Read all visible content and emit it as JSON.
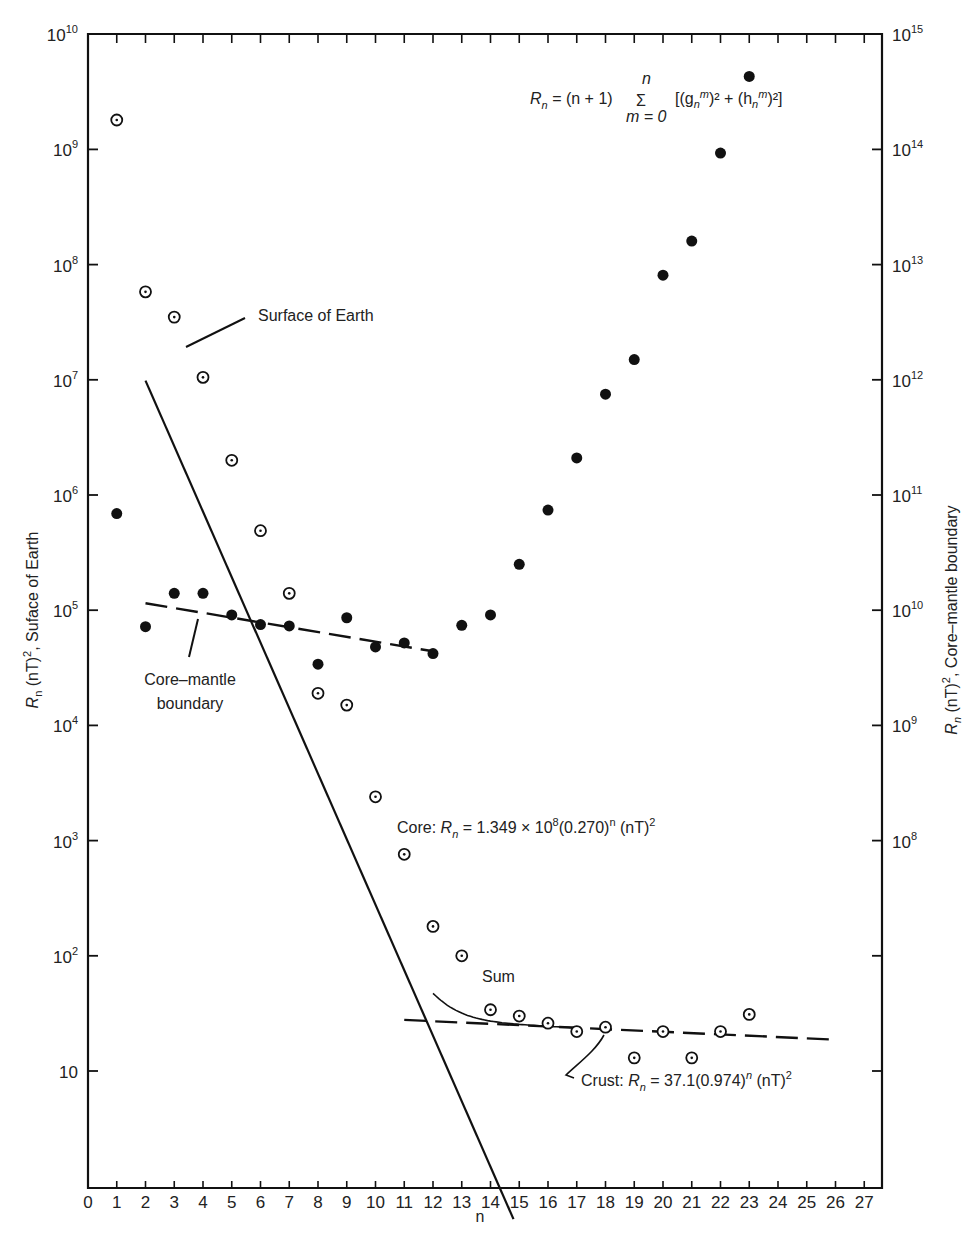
{
  "chart_data": {
    "type": "scatter",
    "title": "",
    "xlabel": "n",
    "ylabel_left": "Rn (nT)², Suface of Earth",
    "ylabel_right": "Rn (nT)², Core–mantle boundary",
    "x_ticks": [
      0,
      1,
      2,
      3,
      4,
      5,
      6,
      7,
      8,
      9,
      10,
      11,
      12,
      13,
      14,
      15,
      16,
      17,
      18,
      19,
      20,
      21,
      22,
      23,
      24,
      25,
      26,
      27
    ],
    "xlim": [
      0,
      27.8
    ],
    "yscale": "log",
    "ylim_left": [
      1,
      10000000000
    ],
    "ylim_right": [
      100000,
      1000000000000000
    ],
    "left_tick_labels": [
      {
        "base": "10",
        "exp": "10",
        "value": 10000000000.0
      },
      {
        "base": "10",
        "exp": "9",
        "value": 1000000000.0
      },
      {
        "base": "10",
        "exp": "8",
        "value": 100000000.0
      },
      {
        "base": "10",
        "exp": "7",
        "value": 10000000.0
      },
      {
        "base": "10",
        "exp": "6",
        "value": 1000000.0
      },
      {
        "base": "10",
        "exp": "5",
        "value": 100000.0
      },
      {
        "base": "10",
        "exp": "4",
        "value": 10000.0
      },
      {
        "base": "10",
        "exp": "3",
        "value": 1000.0
      },
      {
        "base": "10",
        "exp": "2",
        "value": 100.0
      },
      {
        "base": "10",
        "exp": "",
        "value": 10
      }
    ],
    "right_tick_labels": [
      {
        "base": "10",
        "exp": "15",
        "value": 1000000000000000.0
      },
      {
        "base": "10",
        "exp": "14",
        "value": 100000000000000.0
      },
      {
        "base": "10",
        "exp": "13",
        "value": 10000000000000.0
      },
      {
        "base": "10",
        "exp": "12",
        "value": 1000000000000.0
      },
      {
        "base": "10",
        "exp": "11",
        "value": 100000000000.0
      },
      {
        "base": "10",
        "exp": "10",
        "value": 10000000000.0
      },
      {
        "base": "10",
        "exp": "9",
        "value": 1000000000.0
      },
      {
        "base": "10",
        "exp": "8",
        "value": 100000000.0
      },
      {
        "base": "",
        "exp": "",
        "value": 10000000.0
      },
      {
        "base": "",
        "exp": "",
        "value": 1000000.0
      }
    ],
    "grid": false,
    "series": [
      {
        "name": "Surface of Earth",
        "marker": "open-circle-dot",
        "axis": "left",
        "x": [
          1,
          2,
          3,
          4,
          5,
          6,
          7,
          8,
          9,
          10,
          11,
          12,
          13,
          14,
          15,
          16,
          17,
          18,
          19,
          20,
          21,
          22,
          23
        ],
        "values": [
          1800000000,
          58000000,
          35000000,
          10500000,
          2000000,
          490000,
          140000,
          19000,
          15000,
          2400,
          760,
          180,
          100,
          34,
          30,
          26,
          22,
          24,
          13,
          22,
          13,
          22,
          31
        ]
      },
      {
        "name": "Core–mantle boundary",
        "marker": "filled-circle",
        "axis": "right",
        "x": [
          1,
          2,
          3,
          4,
          5,
          6,
          7,
          8,
          9,
          10,
          11,
          12,
          13,
          14,
          15,
          16,
          17,
          18,
          19,
          20,
          21,
          22,
          23
        ],
        "values": [
          69000000000,
          7200000000,
          14000000000,
          14000000000,
          9100000000,
          7500000000,
          7300000000,
          3400000000,
          8600000000,
          4800000000,
          5200000000,
          4200000000,
          7400000000,
          9100000000,
          25000000000,
          74000000000,
          210000000000,
          750000000000,
          1500000000000,
          8100000000000,
          16000000000000,
          93000000000000,
          430000000000000
        ]
      }
    ],
    "fit_lines": [
      {
        "name": "Core",
        "style": "solid",
        "formula": "Rn = 1.349×10^8 (0.270)^n (nT)^2",
        "x_range": [
          2,
          14.8
        ]
      },
      {
        "name": "Crust",
        "style": "dashed",
        "formula": "Rn = 37.1 (0.974)^n (nT)^2",
        "x_range": [
          11,
          26
        ]
      },
      {
        "name": "Sum",
        "style": "solid-curve",
        "x_range": [
          12,
          17
        ]
      },
      {
        "name": "Core–mantle boundary fit",
        "style": "dashed",
        "axis": "right",
        "x_range": [
          2,
          12
        ],
        "values_at_ends": [
          11500000000,
          4400000000
        ]
      }
    ],
    "annotations": {
      "main_formula": {
        "lhs": "R",
        "lhs_sub": "n",
        "eq": " = (n + 1) ",
        "sum": "Σ",
        "sum_top": "n",
        "sum_bottom": "m = 0",
        "rhs": "[(g",
        "rhs_sub1": "n",
        "rhs_sup1": "m",
        "rhs_mid": ")² + (h",
        "rhs_sub2": "n",
        "rhs_sup2": "m",
        "rhs_end": ")²]"
      },
      "surface_label": "Surface of Earth",
      "cmb_label_line1": "Core–mantle",
      "cmb_label_line2": "boundary",
      "core_label_prefix": "Core: ",
      "core_label_R": "R",
      "core_label_sub": "n",
      "core_label_rest": " = 1.349 × 10",
      "core_label_exp": "8",
      "core_label_tail": "(0.270)",
      "core_label_tail_exp": "n",
      "core_label_unit": " (nT)",
      "core_label_unit_exp": "2",
      "sum_label": "Sum",
      "crust_label_prefix": "Crust: ",
      "crust_label_R": "R",
      "crust_label_sub": "n",
      "crust_label_rest": " = 37.1(0.974)",
      "crust_label_exp": "n",
      "crust_label_unit": " (nT)",
      "crust_label_unit_exp": "2"
    },
    "axis_title_left": {
      "R": "R",
      "sub": "n",
      "rest": " (nT)",
      "exp": "2",
      "tail": ", Suface of Earth"
    },
    "axis_title_right": {
      "R": "R",
      "sub": "n",
      "rest": " (nT)",
      "exp": "2",
      "tail": ", Core–mantle boundary"
    }
  }
}
